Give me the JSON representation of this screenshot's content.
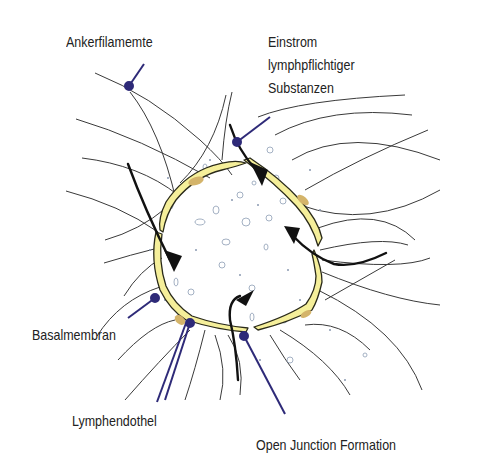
{
  "diagram": {
    "labels": {
      "ankerfilamente": "Ankerfilamemte",
      "einstrom_1": "Einstrom",
      "einstrom_2": "lymphpflichtiger",
      "einstrom_3": "Substanzen",
      "basalmembran": "Basalmembran",
      "lymphendothel": "Lymphendothel",
      "open_junction": "Open Junction Formation"
    },
    "colors": {
      "endothel_fill": "#f5ef9a",
      "endothel_outline": "#2a2a1a",
      "nucleus": "#d4b46a",
      "pointer": "#2e2a78",
      "filament": "#3a3a3a",
      "arrow": "#111111",
      "particles": "#9aa8bc"
    }
  }
}
